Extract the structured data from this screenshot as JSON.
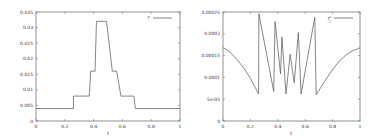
{
  "chart_data": [
    {
      "type": "line",
      "title": "",
      "xlabel": "t",
      "ylabel": "",
      "xlim": [
        0,
        1
      ],
      "ylim": [
        0,
        0.035
      ],
      "grid": false,
      "legend_position": "top-right",
      "x_ticks": [
        "0",
        "0.2",
        "0.4",
        "0.6",
        "0.8",
        "1"
      ],
      "y_ticks": [
        "0",
        "0.005",
        "0.01",
        "0.015",
        "0.02",
        "0.025",
        "0.03",
        "0.035"
      ],
      "series": [
        {
          "name": "r",
          "x": [
            0,
            0.26,
            0.26,
            0.37,
            0.38,
            0.41,
            0.42,
            0.49,
            0.53,
            0.56,
            0.59,
            0.68,
            0.69,
            1.0
          ],
          "y": [
            0.004,
            0.004,
            0.008,
            0.008,
            0.016,
            0.016,
            0.032,
            0.032,
            0.016,
            0.016,
            0.008,
            0.008,
            0.004,
            0.004
          ]
        }
      ]
    },
    {
      "type": "line",
      "title": "",
      "xlabel": "t",
      "ylabel": "",
      "xlim": [
        0,
        1
      ],
      "ylim": [
        0,
        0.00025
      ],
      "grid": false,
      "legend_position": "top-right",
      "x_ticks": [
        "0",
        "0.2",
        "0.4",
        "0.6",
        "0.8",
        "1"
      ],
      "y_ticks": [
        "0",
        "5e-05",
        "0.0001",
        "0.00015",
        "0.0002",
        "0.00025"
      ],
      "series": [
        {
          "name": "r_j^a",
          "x": [
            0,
            0.02,
            0.05,
            0.1,
            0.15,
            0.2,
            0.26,
            0.262,
            0.37,
            0.38,
            0.42,
            0.43,
            0.46,
            0.49,
            0.52,
            0.55,
            0.57,
            0.67,
            0.68,
            0.74,
            0.8,
            0.85,
            0.9,
            0.95,
            0.98,
            1.0
          ],
          "y": [
            0.000168,
            0.000165,
            0.000158,
            0.000142,
            0.000122,
            9.8e-05,
            6.2e-05,
            0.000246,
            6.8e-05,
            0.000228,
            0.000108,
            0.000193,
            6.2e-05,
            0.000153,
            8.8e-05,
            0.000203,
            6.2e-05,
            0.000238,
            6e-05,
            9e-05,
            0.000118,
            0.000138,
            0.000152,
            0.000162,
            0.000165,
            0.000168
          ]
        }
      ]
    }
  ],
  "left": {
    "legend": "r",
    "xlabel": "t",
    "x_ticks": [
      "0",
      "0.2",
      "0.4",
      "0.6",
      "0.8",
      "1"
    ],
    "y_ticks": [
      "0",
      "0.005",
      "0.01",
      "0.015",
      "0.02",
      "0.025",
      "0.03",
      "0.035"
    ]
  },
  "right": {
    "legend": "r",
    "legend_sub": "j",
    "legend_sup": "a",
    "xlabel": "t",
    "x_ticks": [
      "0",
      "0.2",
      "0.4",
      "0.6",
      "0.8",
      "1"
    ],
    "y_ticks": [
      "0",
      "5e-05",
      "0.0001",
      "0.00015",
      "0.0002",
      "0.00025"
    ]
  }
}
